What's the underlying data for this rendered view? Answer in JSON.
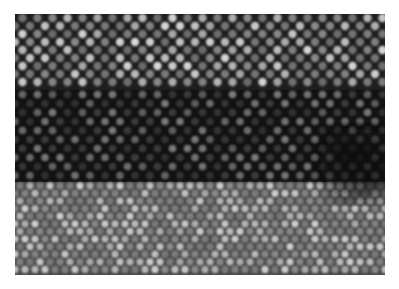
{
  "image": {
    "description": "Grayscale atomic-resolution electron micrograph showing a periodic lattice of bright atom columns",
    "frame": {
      "x": 15,
      "y": 14,
      "width": 370,
      "height": 261
    },
    "page_background": "#ffffff",
    "regions": [
      {
        "name": "upper-lattice",
        "y0": 0,
        "y1": 76,
        "dx": 15,
        "dy": 8,
        "radius": 4.2,
        "bg": "#1e1e1e",
        "bright": "#d8d8d8",
        "dim": "#8a8a8a"
      },
      {
        "name": "dark-band",
        "y0": 76,
        "y1": 168,
        "dx": 15,
        "dy": 9,
        "radius": 3.8,
        "bg": "#121212",
        "bright": "#7a7a7a",
        "dim": "#3c3c3c"
      },
      {
        "name": "lower-lattice",
        "y0": 168,
        "y1": 261,
        "dx": 10,
        "dy": 7.6,
        "radius": 3.6,
        "bg": "#4a4a4a",
        "bright": "#cfcfcf",
        "dim": "#8c8c8c"
      }
    ],
    "dark_patch": {
      "cx": 345,
      "cy": 150,
      "rx": 40,
      "ry": 35,
      "color": "#0a0a0a"
    }
  }
}
